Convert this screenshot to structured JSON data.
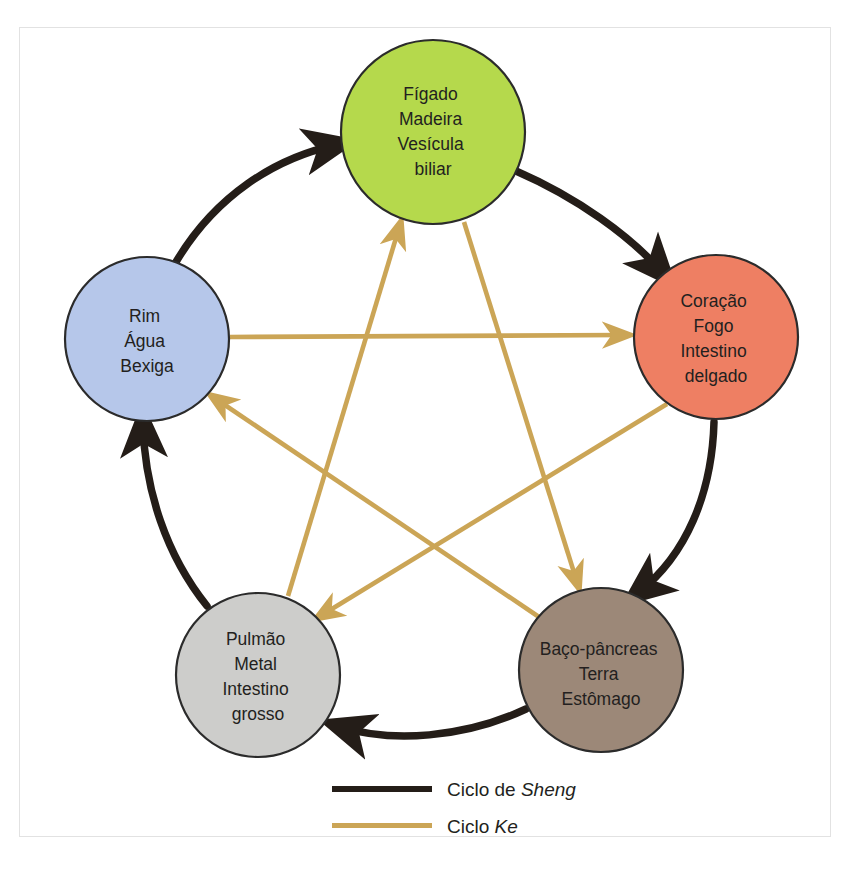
{
  "figure": {
    "background_color": "#ffffff",
    "frame_color": "#e2e2e2"
  },
  "colors": {
    "wood": "#b5d94c",
    "fire": "#ee7f63",
    "earth": "#9c8878",
    "metal": "#cdcdcb",
    "water": "#b6c7ea",
    "node_outline": "#2b2b2b",
    "sheng_line": "#241d18",
    "ke_line": "#cba css",
    "ke_line_hex": "#cbaköz",
    "text": "#231f20"
  },
  "nodes": [
    {
      "id": "wood",
      "element": "Madeira",
      "color": "#b5d94c",
      "cx": 433,
      "cy": 132,
      "r": 92,
      "lines": [
        "Fígado",
        "Madeira",
        "Vesícula",
        "biliar"
      ]
    },
    {
      "id": "fire",
      "element": "Fogo",
      "color": "#ee7f63",
      "cx": 716,
      "cy": 337,
      "r": 82,
      "lines": [
        "Coração",
        "Fogo",
        "Intestino",
        "delgado"
      ]
    },
    {
      "id": "earth",
      "element": "Terra",
      "color": "#9c8878",
      "cx": 601,
      "cy": 670,
      "r": 82,
      "lines": [
        "Baço-pâncreas",
        "Terra",
        "Estômago"
      ]
    },
    {
      "id": "metal",
      "element": "Metal",
      "color": "#cdcdcb",
      "cx": 258,
      "cy": 675,
      "r": 82,
      "lines": [
        "Pulmão",
        "Metal",
        "Intestino",
        "grosso"
      ]
    },
    {
      "id": "water",
      "element": "Água",
      "color": "#b6c7ea",
      "cx": 147,
      "cy": 339,
      "r": 82,
      "lines": [
        "Rim",
        "Água",
        "Bexiga"
      ]
    }
  ],
  "sheng_cycle": {
    "name": "Ciclo de Sheng",
    "line_color": "#241d18",
    "edges": [
      {
        "from": "water",
        "to": "wood",
        "label": "Água gera Madeira"
      },
      {
        "from": "wood",
        "to": "fire",
        "label": "Madeira gera Fogo"
      },
      {
        "from": "fire",
        "to": "earth",
        "label": "Fogo gera Terra"
      },
      {
        "from": "earth",
        "to": "metal",
        "label": "Terra gera Metal"
      },
      {
        "from": "metal",
        "to": "water",
        "label": "Metal gera Água"
      }
    ]
  },
  "ke_cycle": {
    "name": "Ciclo Ke",
    "line_color": "#cba556",
    "edges": [
      {
        "from": "water",
        "to": "fire",
        "label": "Água controla Fogo"
      },
      {
        "from": "fire",
        "to": "metal",
        "label": "Fogo controla Metal"
      },
      {
        "from": "metal",
        "to": "wood",
        "label": "Metal controla Madeira"
      },
      {
        "from": "wood",
        "to": "earth",
        "label": "Madeira controla Terra"
      },
      {
        "from": "earth",
        "to": "water",
        "label": "Terra controla Água"
      }
    ]
  },
  "legend": {
    "items": [
      {
        "id": "sheng",
        "prefix": "Ciclo de ",
        "emphasis": "Sheng",
        "color": "#241d18",
        "swatch_width": 100,
        "swatch_height": 6
      },
      {
        "id": "ke",
        "prefix": "Ciclo ",
        "emphasis": "Ke",
        "color": "#cba556",
        "swatch_width": 100,
        "swatch_height": 5
      }
    ]
  }
}
